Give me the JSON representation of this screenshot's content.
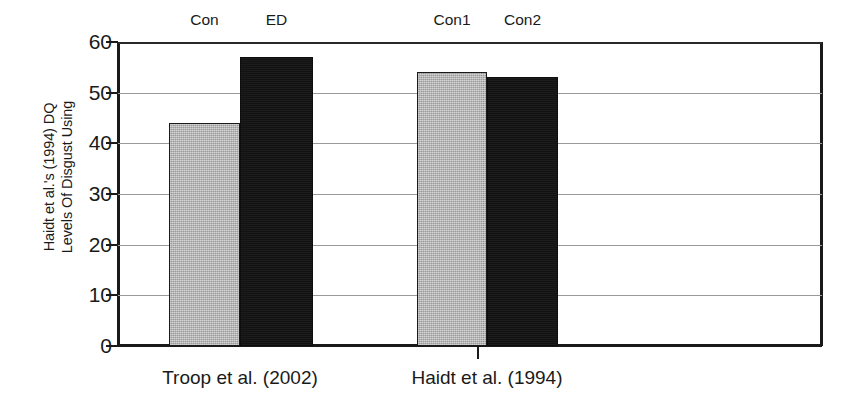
{
  "chart_data": {
    "type": "bar",
    "title": "",
    "xlabel": "",
    "ylabel_line1": "Levels Of Disgust Using",
    "ylabel_line2": "Haidt et al.'s (1994) DQ",
    "ylim": [
      0,
      60
    ],
    "yticks": [
      0,
      10,
      20,
      30,
      40,
      50,
      60
    ],
    "ytick_labels": [
      "0",
      "10",
      "20",
      "30",
      "40",
      "50",
      "60"
    ],
    "grid": true,
    "legend": "none",
    "groups": [
      {
        "label": "Troop et al. (2002)",
        "bars": [
          {
            "label": "Con",
            "value": 44,
            "color": "#adadad",
            "style": "gray"
          },
          {
            "label": "ED",
            "value": 57,
            "color": "#121212",
            "style": "black"
          }
        ]
      },
      {
        "label": "Haidt et al. (1994)",
        "bars": [
          {
            "label": "Con1",
            "value": 54,
            "color": "#adadad",
            "style": "gray"
          },
          {
            "label": "Con2",
            "value": 53,
            "color": "#121212",
            "style": "black"
          }
        ]
      }
    ],
    "categories": [
      "Con",
      "ED",
      "Con1",
      "Con2"
    ],
    "values": [
      44,
      57,
      54,
      53
    ],
    "colors": {
      "gray_bar": "#adadad",
      "black_bar": "#121212",
      "axis": "#1a1a1a",
      "gridline": "#9a9a9a",
      "background": "#ffffff"
    }
  },
  "layout": {
    "plot_left_px": 118,
    "plot_top_px": 42,
    "plot_width_px": 704,
    "plot_height_px": 304,
    "bars_px": [
      {
        "left": 51,
        "width": 71
      },
      {
        "left": 122,
        "width": 73
      },
      {
        "left": 299,
        "width": 70
      },
      {
        "left": 369,
        "width": 71
      }
    ],
    "group_label_centers_px": [
      240,
      487
    ],
    "group_divider_x_px": 477
  }
}
